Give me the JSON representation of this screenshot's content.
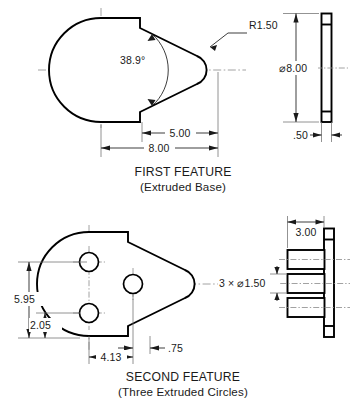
{
  "sheet": {
    "background_color": "#ffffff",
    "line_color": "#000000",
    "center_line_color": "#8a8a8a",
    "dimension_color": "#1a1a1a"
  },
  "first_feature": {
    "caption_title": "FIRST FEATURE",
    "caption_subtitle": "(Extruded Base)",
    "dimensions": {
      "radius_nose": "R1.50",
      "taper_angle": "38.9°",
      "length_front": "5.00",
      "length_overall": "8.00",
      "diameter_side": "⌀8.00",
      "thickness_side": ".50"
    }
  },
  "second_feature": {
    "caption_title": "SECOND FEATURE",
    "caption_subtitle": "(Three Extruded Circles)",
    "dimensions": {
      "height_overall": "5.95",
      "height_lower": "2.05",
      "offset_horizontal": "4.13",
      "offset_small": ".75",
      "hole_callout": "3 × ⌀1.50",
      "boss_length": "3.00"
    }
  }
}
